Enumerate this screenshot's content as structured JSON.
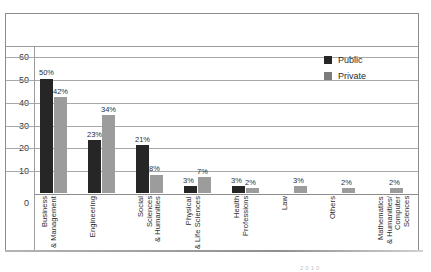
{
  "legend": {
    "position": "top-right",
    "entries": [
      {
        "label": "Public",
        "color": "#262626",
        "swatch": "public-swatch"
      },
      {
        "label": "Private",
        "color": "#7c7c7c",
        "swatch": "private-swatch"
      }
    ]
  },
  "caption_fragment": "2010",
  "axis": {
    "y_ticks": [
      "60",
      "50",
      "40",
      "30",
      "20",
      "10",
      "0"
    ]
  },
  "chart_data": {
    "type": "bar",
    "title": "",
    "subtitle": "",
    "xlabel": "",
    "ylabel": "",
    "ylim": [
      0,
      65
    ],
    "y_ticks": [
      0,
      10,
      20,
      30,
      40,
      50,
      60
    ],
    "grid": true,
    "legend_position": "top-right",
    "value_format": "percent",
    "categories": [
      "Business & Management",
      "Engineering",
      "Social Sciences & Humanities",
      "Physical & Life Sciences",
      "Health Professions",
      "Law",
      "Others",
      "Mathematics & Humanities/ Computer Sciences"
    ],
    "series": [
      {
        "name": "Public",
        "color": "#262626",
        "values": [
          50,
          23,
          21,
          3,
          3,
          null,
          null,
          null
        ],
        "labels": [
          "50%",
          "23%",
          "21%",
          "3%",
          "3%",
          "",
          "",
          ""
        ]
      },
      {
        "name": "Private",
        "color": "#9c9c9c",
        "values": [
          42,
          34,
          8,
          7,
          2,
          3,
          2,
          2
        ],
        "labels": [
          "42%",
          "34%",
          "8%",
          "7%",
          "2%",
          "3%",
          "2%",
          "2%"
        ]
      }
    ]
  }
}
